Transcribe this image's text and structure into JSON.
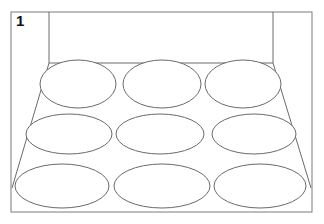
{
  "panel": {
    "label": "1",
    "description": "Perspective view of an open box / room with a 3x3 grid of oval shapes on the floor"
  },
  "colors": {
    "background": "#ffffff",
    "stroke": "#6a6a6a",
    "frame_stroke": "#7a7a7a",
    "label": "#111111"
  },
  "geometry": {
    "frame": {
      "x": 11,
      "y": 12,
      "w": 301,
      "h": 200
    },
    "back_wall": {
      "x": 49,
      "y": 12,
      "w": 224,
      "h": 51
    },
    "floor": {
      "back_left": [
        49,
        63
      ],
      "back_right": [
        273,
        63
      ],
      "front_left": [
        12,
        188
      ],
      "front_right": [
        311,
        188
      ]
    },
    "ovals": [
      {
        "row": 1,
        "col": 1,
        "cx": 78,
        "cy": 84,
        "rx": 38,
        "ry": 24
      },
      {
        "row": 1,
        "col": 2,
        "cx": 162,
        "cy": 84,
        "rx": 39,
        "ry": 24
      },
      {
        "row": 1,
        "col": 3,
        "cx": 243,
        "cy": 84,
        "rx": 38,
        "ry": 24
      },
      {
        "row": 2,
        "col": 1,
        "cx": 69,
        "cy": 134,
        "rx": 43,
        "ry": 20
      },
      {
        "row": 2,
        "col": 2,
        "cx": 160,
        "cy": 134,
        "rx": 44,
        "ry": 20
      },
      {
        "row": 2,
        "col": 3,
        "cx": 254,
        "cy": 134,
        "rx": 42,
        "ry": 20
      },
      {
        "row": 3,
        "col": 1,
        "cx": 62,
        "cy": 186,
        "rx": 47,
        "ry": 22
      },
      {
        "row": 3,
        "col": 2,
        "cx": 162,
        "cy": 186,
        "rx": 48,
        "ry": 22
      },
      {
        "row": 3,
        "col": 3,
        "cx": 260,
        "cy": 186,
        "rx": 46,
        "ry": 22
      }
    ]
  }
}
